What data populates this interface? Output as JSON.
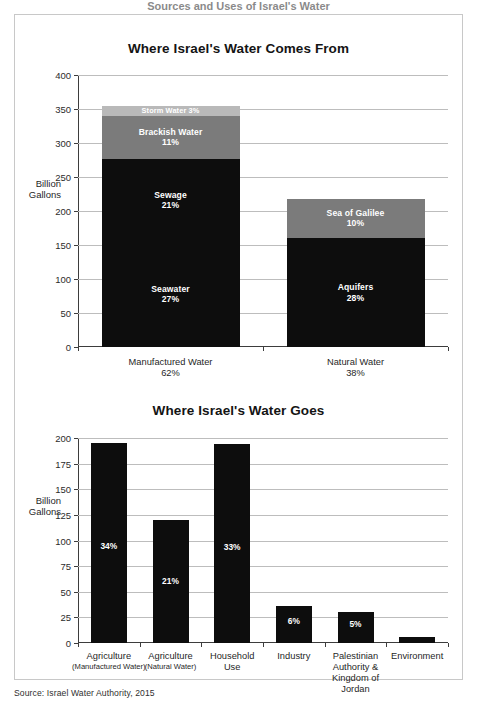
{
  "banner": {
    "headline": "Sources and Uses of Israel's Water"
  },
  "source_note": "Source: Israel Water Authority, 2015",
  "colors": {
    "dark": "#0d0d0d",
    "mid": "#7b7b7b",
    "light": "#b9b9b9",
    "grid": "#bdbdbd",
    "axis": "#3d3d3d",
    "frame": "#c8c8c8"
  },
  "chart_data": [
    {
      "type": "bar",
      "stacked": true,
      "title": "Where Israel's Water Comes From",
      "xlabel": "",
      "ylabel": "Billion\nGallons",
      "ylim": [
        0,
        400
      ],
      "yticks": [
        0,
        50,
        100,
        150,
        200,
        250,
        300,
        350,
        400
      ],
      "ytick_labels": [
        "0",
        "50",
        "100",
        "150",
        "200",
        "250",
        "300",
        "350",
        "400"
      ],
      "grid": true,
      "legend": "none",
      "categories": [
        "Manufactured Water",
        "Natural Water"
      ],
      "category_pcts": [
        "62%",
        "38%"
      ],
      "bars": [
        {
          "category": "Manufactured Water",
          "pct": "62%",
          "total": 355,
          "segments": [
            {
              "name": "Seawater",
              "pct": "27%",
              "value": 155,
              "shade": "dark",
              "label": "Seawater\n27%"
            },
            {
              "name": "Sewage",
              "pct": "21%",
              "value": 122,
              "shade": "dark",
              "label": "Sewage\n21%"
            },
            {
              "name": "Brackish Water",
              "pct": "11%",
              "value": 63,
              "shade": "mid",
              "label": "Brackish Water\n11%"
            },
            {
              "name": "Storm Water",
              "pct": "3%",
              "value": 15,
              "shade": "light",
              "label": "Storm Water 3%"
            }
          ]
        },
        {
          "category": "Natural Water",
          "pct": "38%",
          "total": 218,
          "segments": [
            {
              "name": "Aquifers",
              "pct": "28%",
              "value": 160,
              "shade": "dark",
              "label": "Aquifers\n28%"
            },
            {
              "name": "Sea of Galilee",
              "pct": "10%",
              "value": 58,
              "shade": "mid",
              "label": "Sea of Galilee\n10%"
            }
          ]
        }
      ]
    },
    {
      "type": "bar",
      "stacked": false,
      "title": "Where Israel's Water Goes",
      "xlabel": "",
      "ylabel": "Billion\nGallons",
      "ylim": [
        0,
        200
      ],
      "yticks": [
        0,
        25,
        50,
        75,
        100,
        125,
        150,
        175,
        200
      ],
      "ytick_labels": [
        "0",
        "25",
        "50",
        "75",
        "100",
        "125",
        "150",
        "175",
        "200"
      ],
      "grid": true,
      "legend": "none",
      "categories": [
        "Agriculture",
        "Agriculture",
        "Household\nUse",
        "Industry",
        "Palestinian\nAuthority &\nKingdom of\nJordan",
        "Environment"
      ],
      "category_subs": [
        "(Manufactured Water)",
        "(Natural Water)",
        "",
        "",
        "",
        ""
      ],
      "values": [
        195,
        120,
        194,
        36,
        30,
        6
      ],
      "data_labels": [
        "34%",
        "21%",
        "33%",
        "6%",
        "5%",
        "1%"
      ]
    }
  ]
}
